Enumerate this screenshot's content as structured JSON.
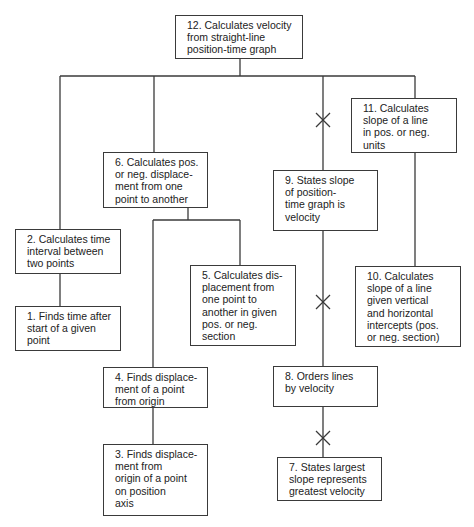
{
  "diagram": {
    "type": "learning-hierarchy",
    "nodes": [
      {
        "id": 12,
        "text": "12. Calculates velocity\nfrom straight-line\nposition-time graph"
      },
      {
        "id": 11,
        "text": "11. Calculates\nslope of a line\nin pos. or neg.\nunits"
      },
      {
        "id": 6,
        "text": "6. Calculates pos.\nor neg. displace-\nment from one\npoint to another"
      },
      {
        "id": 9,
        "text": "9. States slope\nof position-\ntime graph is\nvelocity"
      },
      {
        "id": 2,
        "text": "2. Calculates time\ninterval between\ntwo points"
      },
      {
        "id": 1,
        "text": "1. Finds time after\nstart of a given\npoint"
      },
      {
        "id": 5,
        "text": "5. Calculates dis-\nplacement from\none point to\nanother in given\npos. or neg.\nsection"
      },
      {
        "id": 10,
        "text": "10. Calculates\nslope of a line\ngiven vertical\nand horizontal\nintercepts (pos.\nor neg. section)"
      },
      {
        "id": 4,
        "text": "4. Finds displace-\nment of a point\nfrom origin"
      },
      {
        "id": 3,
        "text": "3. Finds displace-\nment from\norigin of a point\non position\naxis"
      },
      {
        "id": 8,
        "text": "8. Orders lines\nby velocity"
      },
      {
        "id": 7,
        "text": "7. States largest\nslope represents\ngreatest velocity"
      }
    ],
    "edges": [
      {
        "from": 2,
        "to": 12
      },
      {
        "from": 6,
        "to": 12
      },
      {
        "from": 9,
        "to": 12,
        "crossed": true
      },
      {
        "from": 11,
        "to": 12
      },
      {
        "from": 1,
        "to": 2
      },
      {
        "from": 5,
        "to": 6
      },
      {
        "from": 4,
        "to": 6
      },
      {
        "from": 8,
        "to": 9,
        "crossed": true
      },
      {
        "from": 10,
        "to": 11
      },
      {
        "from": 3,
        "to": 4
      },
      {
        "from": 7,
        "to": 8,
        "crossed": true
      }
    ],
    "colors": {
      "line": "#3a3a3a",
      "background": "#ffffff",
      "text": "#222222"
    }
  }
}
